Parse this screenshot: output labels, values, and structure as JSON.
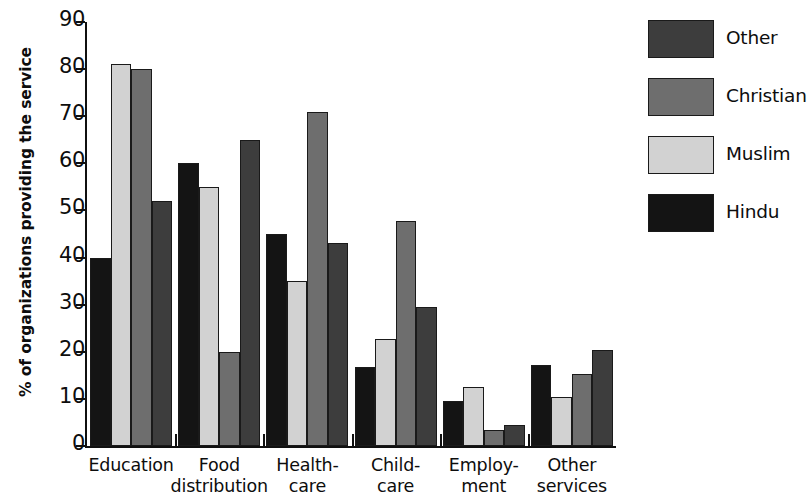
{
  "chart_data": {
    "type": "bar",
    "title": "",
    "xlabel": "",
    "ylabel": "% of organizations providing the service",
    "ylim": [
      0,
      90
    ],
    "ytick_step": 10,
    "yticks": [
      0,
      10,
      20,
      30,
      40,
      50,
      60,
      70,
      80,
      90
    ],
    "grid": false,
    "legend_position": "right",
    "categories": [
      "Education",
      "Food distribution",
      "Health-care",
      "Child-care",
      "Employ-ment",
      "Other services"
    ],
    "category_lines": [
      [
        "Education",
        ""
      ],
      [
        "Food",
        "distribution"
      ],
      [
        "Health-",
        "care"
      ],
      [
        "Child-",
        "care"
      ],
      [
        "Employ-",
        "ment"
      ],
      [
        "Other",
        "services"
      ]
    ],
    "series": [
      {
        "name": "Hindu",
        "color": "#141414",
        "values": [
          40.0,
          60.0,
          45.0,
          16.8,
          9.5,
          17.3
        ]
      },
      {
        "name": "Muslim",
        "color": "#d2d2d2",
        "values": [
          81.0,
          55.0,
          35.0,
          22.7,
          12.5,
          10.5
        ]
      },
      {
        "name": "Christian",
        "color": "#6e6e6e",
        "values": [
          80.0,
          20.0,
          70.8,
          47.8,
          3.5,
          15.3
        ]
      },
      {
        "name": "Other",
        "color": "#3d3d3d",
        "values": [
          52.0,
          65.0,
          43.0,
          29.6,
          4.5,
          20.3
        ]
      }
    ]
  },
  "legend": {
    "entries": [
      {
        "label": "Other",
        "color": "#3d3d3d"
      },
      {
        "label": "Christian",
        "color": "#6e6e6e"
      },
      {
        "label": "Muslim",
        "color": "#d2d2d2"
      },
      {
        "label": "Hindu",
        "color": "#141414"
      }
    ]
  }
}
